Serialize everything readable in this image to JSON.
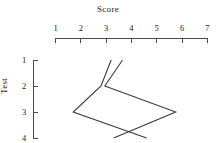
{
  "chart_data": {
    "type": "line",
    "title": "Score",
    "xlabel": "Score",
    "ylabel": "Test",
    "orientation": "x-axis-on-top, y-axis-inverted",
    "xlim": [
      1,
      7
    ],
    "ylim": [
      1,
      4
    ],
    "x_ticks": [
      "1",
      "2",
      "3",
      "4",
      "5",
      "6",
      "7"
    ],
    "y_ticks": [
      "1",
      "2",
      "3",
      "4"
    ],
    "grid": false,
    "legend": "none",
    "categories": [
      1,
      2,
      3,
      4
    ],
    "series": [
      {
        "name": "profile-a",
        "values": [
          3.2,
          2.8,
          1.7,
          4.6
        ]
      },
      {
        "name": "profile-b",
        "values": [
          3.65,
          2.95,
          5.75,
          3.3
        ]
      }
    ],
    "line_color": "#3a3a3a",
    "axis_color": "#4a4a4a"
  },
  "axes": {
    "x_title": "Score",
    "y_title": "Test",
    "x_ticks": [
      {
        "label": "1",
        "value": 1
      },
      {
        "label": "2",
        "value": 2
      },
      {
        "label": "3",
        "value": 3
      },
      {
        "label": "4",
        "value": 4
      },
      {
        "label": "5",
        "value": 5
      },
      {
        "label": "6",
        "value": 6
      },
      {
        "label": "7",
        "value": 7
      }
    ],
    "y_ticks": [
      {
        "label": "1",
        "value": 1
      },
      {
        "label": "2",
        "value": 2
      },
      {
        "label": "3",
        "value": 3
      },
      {
        "label": "4",
        "value": 4
      }
    ]
  }
}
